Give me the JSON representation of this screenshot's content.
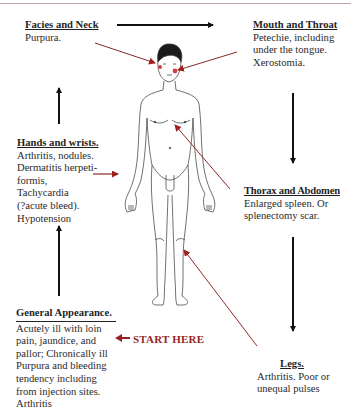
{
  "diagram": {
    "start_label": "START HERE",
    "colors": {
      "accent_red": "#9a1f22",
      "arrow_black": "#111111",
      "pointer_red": "#8b2a2a"
    },
    "sections": {
      "facies": {
        "title": "Facies and Neck",
        "body": "Purpura."
      },
      "mouth": {
        "title": "Mouth and Throat",
        "body": "Petechie, including\nunder the tongue.\nXerostomia."
      },
      "hands": {
        "title": "Hands and wrists.",
        "body": "Arthritis, nodules.\nDermatitis herpeti-\nformis,\nTachycardia\n(?acute bleed).\nHypotension"
      },
      "thorax": {
        "title": "Thorax and Abdomen",
        "body": "Enlarged spleen. Or\nsplenectomy scar."
      },
      "general": {
        "title": "General Appearance.",
        "body": "Acutely ill with loin\npain, jaundice, and\npallor; Chronically ill\nPurpura and bleeding\ntendency including\nfrom injection sites.\nArthritis"
      },
      "legs": {
        "title": "Legs.",
        "body": "Arthritis. Poor or\nunequal pulses"
      }
    },
    "flow_order": [
      "general",
      "hands",
      "facies",
      "mouth",
      "thorax",
      "legs"
    ],
    "figure": "human-body-outline"
  }
}
